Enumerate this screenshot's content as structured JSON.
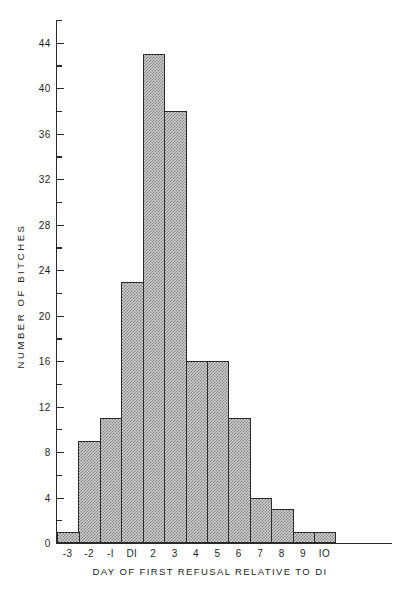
{
  "page_marker": "",
  "chart_data": {
    "type": "bar",
    "title": "",
    "xlabel": "DAY OF FIRST REFUSAL RELATIVE TO DI",
    "ylabel": "NUMBER OF BITCHES",
    "categories": [
      "-3",
      "-2",
      "-I",
      "DI",
      "2",
      "3",
      "4",
      "5",
      "6",
      "7",
      "8",
      "9",
      "IO"
    ],
    "values": [
      1,
      9,
      11,
      23,
      43,
      38,
      16,
      16,
      11,
      4,
      3,
      1,
      1
    ],
    "ylim": [
      0,
      46
    ],
    "xlim": [
      0,
      13
    ],
    "y_major_ticks": [
      0,
      4,
      8,
      12,
      16,
      20,
      24,
      28,
      32,
      36,
      40,
      44
    ],
    "y_major_labels": [
      "0",
      "4",
      "8",
      "12",
      "16",
      "20",
      "24",
      "28",
      "32",
      "36",
      "40",
      "44"
    ],
    "y_minor_ticks": [
      2,
      6,
      10,
      14,
      18,
      22,
      26,
      30,
      34,
      38,
      42,
      46
    ],
    "grid": false,
    "legend": false,
    "bar_fill": "#d2d2d2",
    "bar_edge": "#2b2b2b",
    "bar_pattern": "checkerboard-stipple",
    "background": "#ffffff"
  }
}
